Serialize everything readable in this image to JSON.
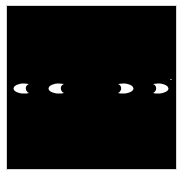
{
  "figure": {
    "background_color": "#000000",
    "frame_color": "#ffffff",
    "shape_color": "#ffffff",
    "shapes": [
      {
        "id": "crescent-1",
        "type": "crescent",
        "opens": "right",
        "x": 13,
        "y": 83,
        "w": 17,
        "h": 11
      },
      {
        "id": "crescent-2",
        "type": "crescent",
        "opens": "right",
        "x": 48,
        "y": 83,
        "w": 17,
        "h": 11
      },
      {
        "id": "crescent-3",
        "type": "crescent",
        "opens": "left",
        "x": 117,
        "y": 83,
        "w": 17,
        "h": 11
      },
      {
        "id": "crescent-4",
        "type": "crescent",
        "opens": "left",
        "x": 152,
        "y": 83,
        "w": 17,
        "h": 11
      }
    ],
    "speck": {
      "x": 170,
      "y": 79,
      "color": "#7a7a7a"
    }
  }
}
